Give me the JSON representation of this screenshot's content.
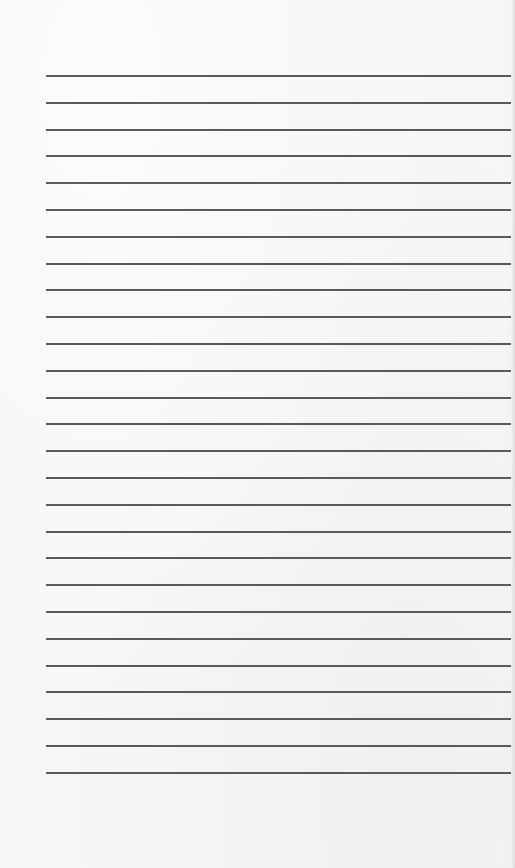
{
  "paper": {
    "description": "Blank lined paper sheet",
    "line_count": 27,
    "first_line_y": 75,
    "line_spacing": 26.8,
    "line_left": 46,
    "line_right": 511,
    "line_color": "#5a5a5a",
    "background_color": "#f6f6f6"
  }
}
